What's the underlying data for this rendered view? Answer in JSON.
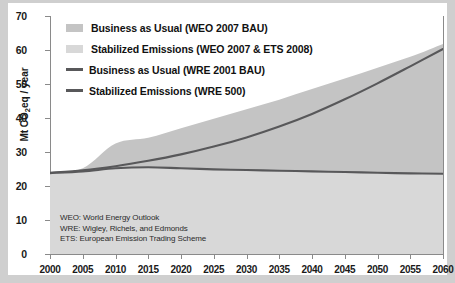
{
  "chart_data": {
    "type": "area",
    "title": "",
    "xlabel": "",
    "ylabel": "Mt CO2eq / year",
    "ylabel_prefix": "Mt CO",
    "ylabel_sub": "2",
    "ylabel_suffix": "eq / year",
    "xlim": [
      2000,
      2060
    ],
    "ylim": [
      0,
      70
    ],
    "grid": false,
    "x_ticks": [
      2000,
      2005,
      2010,
      2015,
      2020,
      2025,
      2030,
      2035,
      2040,
      2045,
      2050,
      2055,
      2060
    ],
    "y_ticks": [
      0,
      10,
      20,
      30,
      40,
      50,
      60,
      70
    ],
    "legend_position": "top-left",
    "series": [
      {
        "name": "Business as Usual (WEO 2007 BAU)",
        "kind": "band-upper",
        "color": "#c4c4c4",
        "x": [
          2000,
          2005,
          2010,
          2015,
          2020,
          2025,
          2030,
          2035,
          2040,
          2045,
          2050,
          2055,
          2060
        ],
        "values": [
          24.0,
          25.2,
          32.5,
          34.2,
          37.0,
          39.8,
          42.6,
          45.4,
          48.5,
          51.6,
          54.8,
          58.0,
          61.8
        ]
      },
      {
        "name": "Stabilized Emissions (WEO 2007 & ETS 2008)",
        "kind": "band-lower",
        "color": "#d8d8d8",
        "x": [
          2000,
          2005,
          2010,
          2015,
          2020,
          2025,
          2030,
          2035,
          2040,
          2045,
          2050,
          2055,
          2060
        ],
        "values": [
          23.8,
          24.3,
          25.3,
          25.6,
          25.3,
          25.0,
          24.8,
          24.6,
          24.4,
          24.2,
          24.0,
          23.8,
          23.6
        ]
      },
      {
        "name": "Business as Usual (WRE 2001 BAU)",
        "kind": "line",
        "color": "#58585a",
        "x": [
          2000,
          2005,
          2010,
          2015,
          2020,
          2025,
          2030,
          2035,
          2040,
          2045,
          2050,
          2055,
          2060
        ],
        "values": [
          23.9,
          24.6,
          25.8,
          27.4,
          29.3,
          31.6,
          34.3,
          37.5,
          41.2,
          45.5,
          50.2,
          55.2,
          60.3
        ]
      },
      {
        "name": "Stabilized Emissions (WRE 500)",
        "kind": "line",
        "color": "#58585a",
        "x": [
          2000,
          2005,
          2010,
          2015,
          2020,
          2025,
          2030,
          2035,
          2040,
          2045,
          2050,
          2055,
          2060
        ],
        "values": [
          23.8,
          24.3,
          25.2,
          25.5,
          25.2,
          24.9,
          24.7,
          24.5,
          24.3,
          24.1,
          23.9,
          23.7,
          23.6
        ]
      }
    ],
    "annotations": [
      "WEO: World Energy Outlook",
      "WRE: Wigley, Richels, and Edmonds",
      "ETS: European Emission Trading Scheme"
    ]
  },
  "legend": {
    "items": [
      {
        "label": "Business as Usual (WEO 2007 BAU)",
        "marker": "swatch",
        "color": "#c4c4c4"
      },
      {
        "label": "Stabilized Emissions (WEO 2007 & ETS 2008)",
        "marker": "swatch",
        "color": "#d8d8d8"
      },
      {
        "label": "Business as Usual (WRE 2001 BAU)",
        "marker": "line",
        "color": "#58585a"
      },
      {
        "label": "Stabilized Emissions (WRE 500)",
        "marker": "line",
        "color": "#58585a"
      }
    ]
  },
  "colors": {
    "band_upper": "#c4c4c4",
    "band_lower": "#d8d8d8",
    "line": "#58585a",
    "axis": "#8a8a8a",
    "text": "#1a1a1a",
    "page_background": "#cfcfcf",
    "plot_background": "#ffffff"
  }
}
